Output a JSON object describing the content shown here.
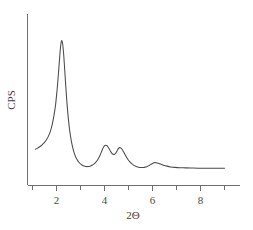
{
  "chart_data": {
    "type": "line",
    "title": "",
    "subtitle": "",
    "xlabel": "2Θ",
    "ylabel": "CPS",
    "xlim": [
      1.0,
      9.0
    ],
    "ylim": [
      0,
      100
    ],
    "grid": false,
    "legend": null,
    "legend_position": "none",
    "x_ticks_major": [
      2,
      4,
      6,
      8
    ],
    "x_tick_labels": [
      "2",
      "4",
      "6",
      "8"
    ],
    "x_ticks_minor": [
      1,
      3,
      5,
      7,
      9
    ],
    "y_ticks": [],
    "y_tick_labels": [],
    "annotations": [],
    "peaks": [
      {
        "x": 2.22,
        "y": 92.0,
        "label": ""
      },
      {
        "x": 4.05,
        "y": 25.5,
        "label": ""
      },
      {
        "x": 4.62,
        "y": 24.0,
        "label": ""
      },
      {
        "x": 6.08,
        "y": 14.5,
        "label": ""
      }
    ],
    "baseline": 11.0,
    "series": [
      {
        "name": "diffraction intensity",
        "color": "#4a4a4a",
        "x": [
          1.12,
          1.2,
          1.3,
          1.4,
          1.5,
          1.58,
          1.66,
          1.74,
          1.82,
          1.9,
          1.96,
          2.02,
          2.06,
          2.1,
          2.14,
          2.18,
          2.22,
          2.26,
          2.3,
          2.34,
          2.4,
          2.46,
          2.54,
          2.62,
          2.72,
          2.82,
          2.94,
          3.06,
          3.18,
          3.3,
          3.42,
          3.54,
          3.64,
          3.74,
          3.82,
          3.9,
          3.96,
          4.02,
          4.06,
          4.12,
          4.18,
          4.24,
          4.3,
          4.36,
          4.42,
          4.48,
          4.54,
          4.6,
          4.66,
          4.72,
          4.8,
          4.9,
          5.0,
          5.12,
          5.24,
          5.38,
          5.52,
          5.66,
          5.78,
          5.88,
          5.98,
          6.06,
          6.14,
          6.24,
          6.34,
          6.46,
          6.6,
          6.76,
          6.94,
          7.14,
          7.36,
          7.6,
          7.9,
          8.2,
          8.5,
          8.8,
          9.0
        ],
        "y": [
          23.0,
          23.6,
          24.6,
          25.8,
          27.4,
          29.0,
          31.2,
          34.2,
          38.6,
          45.0,
          51.0,
          60.0,
          67.0,
          75.0,
          83.0,
          89.5,
          92.0,
          89.5,
          83.0,
          74.0,
          60.0,
          48.0,
          36.0,
          28.0,
          21.5,
          17.5,
          14.6,
          13.0,
          12.2,
          12.0,
          12.4,
          13.4,
          14.8,
          17.0,
          19.4,
          22.4,
          24.4,
          25.4,
          25.5,
          25.0,
          23.6,
          22.0,
          20.6,
          19.8,
          19.8,
          20.8,
          22.4,
          23.8,
          24.0,
          23.2,
          21.2,
          18.4,
          16.0,
          14.0,
          12.6,
          11.8,
          11.4,
          11.5,
          12.0,
          12.9,
          13.8,
          14.4,
          14.5,
          14.2,
          13.6,
          12.9,
          12.3,
          11.8,
          11.5,
          11.3,
          11.2,
          11.1,
          11.0,
          11.0,
          11.0,
          11.0,
          11.0
        ]
      }
    ]
  },
  "axes": {
    "x_axis_name": "two-theta-axis",
    "y_axis_name": "cps-axis"
  }
}
